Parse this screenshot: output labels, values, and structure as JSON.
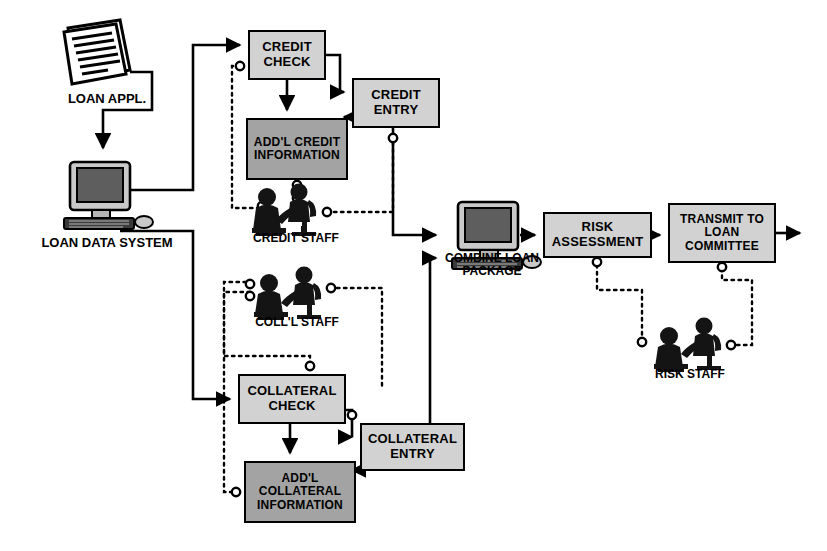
{
  "diagram": {
    "colors": {
      "line": "#000000",
      "box_fill_light": "#d2d2d2",
      "box_fill_dark": "#a3a3a3",
      "box_border": "#000000",
      "background": "#ffffff",
      "icon": "#1a1a1a"
    }
  },
  "boxes": [
    {
      "id": "credit_check",
      "label": "CREDIT\nCHECK",
      "fill": "light",
      "x": 248,
      "y": 30,
      "w": 78,
      "h": 50,
      "font": 13
    },
    {
      "id": "credit_entry",
      "label": "CREDIT\nENTRY",
      "fill": "light",
      "x": 352,
      "y": 78,
      "w": 88,
      "h": 50,
      "font": 13
    },
    {
      "id": "addl_credit_info",
      "label": "ADD'L\nCREDIT\nINFORMATION",
      "fill": "dark",
      "x": 246,
      "y": 118,
      "w": 102,
      "h": 62,
      "font": 12
    },
    {
      "id": "collateral_check",
      "label": "COLLATERAL\nCHECK",
      "fill": "light",
      "x": 238,
      "y": 374,
      "w": 108,
      "h": 50,
      "font": 13
    },
    {
      "id": "collateral_entry",
      "label": "COLLATERAL\nENTRY",
      "fill": "light",
      "x": 360,
      "y": 423,
      "w": 105,
      "h": 48,
      "font": 13
    },
    {
      "id": "addl_coll_info",
      "label": "ADD'L\nCOLLATERAL\nINFORMATION",
      "fill": "dark",
      "x": 244,
      "y": 461,
      "w": 112,
      "h": 62,
      "font": 12
    },
    {
      "id": "risk_assessment",
      "label": "RISK\nASSESSMENT",
      "fill": "light",
      "x": 543,
      "y": 212,
      "w": 109,
      "h": 46,
      "font": 13
    },
    {
      "id": "transmit_committee",
      "label": "TRANSMIT TO\nLOAN\nCOMMITTEE",
      "fill": "light",
      "x": 668,
      "y": 203,
      "w": 108,
      "h": 60,
      "font": 12
    }
  ],
  "captions": [
    {
      "id": "loan_appl",
      "text": "LOAN APPL.",
      "x": 52,
      "y": 92,
      "w": 110,
      "font": 13
    },
    {
      "id": "loan_data_sys",
      "text": "LOAN DATA SYSTEM",
      "x": 22,
      "y": 236,
      "w": 170,
      "font": 13
    },
    {
      "id": "credit_staff",
      "text": "CREDIT STAFF",
      "x": 238,
      "y": 232,
      "w": 116,
      "font": 12
    },
    {
      "id": "coll_staff",
      "text": "COLL'L STAFF",
      "x": 242,
      "y": 316,
      "w": 110,
      "font": 12
    },
    {
      "id": "combine_pkg",
      "text": "COMBINE LOAN\nPACKAGE",
      "x": 428,
      "y": 252,
      "w": 128,
      "font": 12
    },
    {
      "id": "risk_staff",
      "text": "RISK STAFF",
      "x": 640,
      "y": 368,
      "w": 100,
      "font": 12
    }
  ],
  "icons": [
    {
      "id": "document-icon",
      "name": "loan-application-document",
      "x": 62,
      "y": 18,
      "w": 72,
      "h": 66
    },
    {
      "id": "computer-left",
      "name": "loan-data-system-computer",
      "x": 56,
      "y": 160,
      "w": 96,
      "h": 74
    },
    {
      "id": "computer-mid",
      "name": "combine-loan-package-computer",
      "x": 444,
      "y": 200,
      "w": 96,
      "h": 74
    },
    {
      "id": "staff-credit",
      "name": "credit-staff-people",
      "x": 250,
      "y": 184,
      "w": 78,
      "h": 48
    },
    {
      "id": "staff-coll",
      "name": "collateral-staff-people",
      "x": 252,
      "y": 268,
      "w": 78,
      "h": 48
    },
    {
      "id": "staff-risk",
      "name": "risk-staff-people",
      "x": 652,
      "y": 318,
      "w": 78,
      "h": 50
    }
  ],
  "connectors": {
    "solid_arrows": 11,
    "dotted_links": 9,
    "junction_circle_count": 12,
    "note": "solid lines = process flow; dotted lines = staff interaction links with small open circles"
  }
}
